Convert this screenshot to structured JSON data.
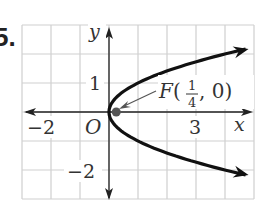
{
  "problem_number": "5.",
  "chart_data": {
    "type": "line",
    "title": "",
    "equation_implied": "y^2 = x",
    "xlabel": "x",
    "ylabel": "y",
    "xlim": [
      -3,
      5
    ],
    "ylim": [
      -3,
      3
    ],
    "grid": true,
    "grid_step": 1,
    "x_tick_labels": [
      {
        "value": -2,
        "label": "−2"
      },
      {
        "value": 3,
        "label": "3"
      }
    ],
    "y_tick_labels": [
      {
        "value": 1,
        "label": "1"
      },
      {
        "value": -2,
        "label": "−2"
      }
    ],
    "origin_label": "O",
    "series": [
      {
        "name": "parabola",
        "x": [
          5,
          4,
          2.25,
          1,
          0.25,
          0,
          0.25,
          1,
          2.25,
          4,
          5
        ],
        "y": [
          2.236,
          2,
          1.5,
          1,
          0.5,
          0,
          -0.5,
          -1,
          -1.5,
          -2,
          -2.236
        ]
      }
    ],
    "points": [
      {
        "name": "focus",
        "x": 0.25,
        "y": 0,
        "label": "F(1/4, 0)"
      }
    ],
    "annotation": {
      "prefix": "F(",
      "num": "1",
      "den": "4",
      "suffix": ", 0)"
    }
  },
  "colors": {
    "grid": "#cfcfcf",
    "axis": "#222222",
    "curve": "#111111",
    "focus": "#555555"
  }
}
